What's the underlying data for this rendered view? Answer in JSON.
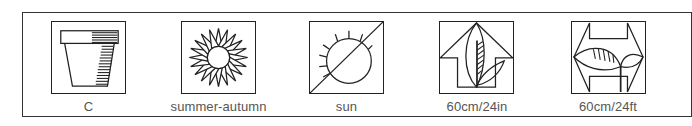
{
  "legend": {
    "items": [
      {
        "icon": "pot-icon",
        "label": "C",
        "box_left": 51,
        "label_center": 89
      },
      {
        "icon": "sunflower-icon",
        "label": "summer-autumn",
        "box_left": 181,
        "label_center": 217
      },
      {
        "icon": "sun-shade-icon",
        "label": "sun",
        "box_left": 309,
        "label_center": 346
      },
      {
        "icon": "height-arrow-icon",
        "label": "60cm/24in",
        "box_left": 439,
        "label_center": 475
      },
      {
        "icon": "spread-arrow-icon",
        "label": "60cm/24ft",
        "box_left": 571,
        "label_center": 606
      }
    ]
  },
  "colors": {
    "stroke": "#222222",
    "text": "#555555",
    "frame": "#333333",
    "background": "#ffffff"
  }
}
